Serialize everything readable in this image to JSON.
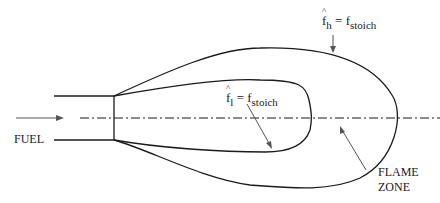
{
  "diagram": {
    "labels": {
      "fuel": "FUEL",
      "flame_zone_line1": "FLAME",
      "flame_zone_line2": "ZONE",
      "outer_contour": {
        "lhs_symbol": "f",
        "lhs_subscript": "h",
        "equals": "=",
        "rhs_symbol": "f",
        "rhs_subscript": "stoich"
      },
      "inner_contour": {
        "lhs_symbol": "f",
        "lhs_subscript": "l",
        "equals": "=",
        "rhs_symbol": "f",
        "rhs_subscript": "stoich"
      }
    },
    "colors": {
      "stroke": "#1a1a1a",
      "background": "#ffffff"
    }
  }
}
